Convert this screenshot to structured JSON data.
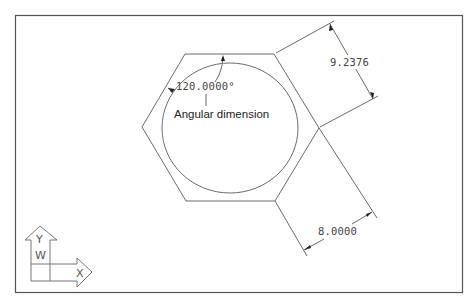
{
  "drawing": {
    "frame": {
      "x": 15,
      "y": 15,
      "width": 448,
      "height": 278,
      "color": "#555555"
    },
    "line_color": "#6b6b6b",
    "hexagon": {
      "vertices": [
        [
          185,
          54
        ],
        [
          274,
          54
        ],
        [
          319,
          128
        ],
        [
          275,
          201
        ],
        [
          186,
          201
        ],
        [
          142,
          127
        ]
      ]
    },
    "circle": {
      "cx": 230,
      "cy": 128,
      "rx": 68,
      "ry": 65
    },
    "dimensions": {
      "aligned_top": {
        "text": "9.2376",
        "description": "aligned dimension across flats"
      },
      "aligned_bottom": {
        "text": "8.0000",
        "description": "aligned dimension of hexagon side"
      },
      "angular": {
        "text": "120.0000°",
        "description": "interior angle"
      }
    },
    "annotation": {
      "text": "Angular dimension"
    },
    "ucs_icon": {
      "y_label": "Y",
      "w_label": "W",
      "x_label": "X"
    }
  }
}
